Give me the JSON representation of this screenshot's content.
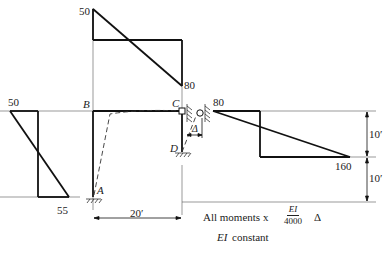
{
  "figure": {
    "nodes": {
      "A": "A",
      "B": "B",
      "C": "C",
      "D": "D"
    },
    "delta_label": "Δ",
    "top_moment": {
      "left_value": "50",
      "right_value": "80"
    },
    "left_moment": {
      "top_value": "50",
      "bottom_value": "55"
    },
    "right_moment": {
      "left_value": "80",
      "right_value": "160"
    },
    "dimensions": {
      "span": "20′",
      "upper_height": "10′",
      "lower_height": "10′"
    },
    "note": {
      "prefix": "All moments x",
      "frac_num": "EI",
      "frac_den": "4000",
      "suffix": "Δ",
      "ei_label": "EI",
      "ei_text": "constant"
    }
  }
}
